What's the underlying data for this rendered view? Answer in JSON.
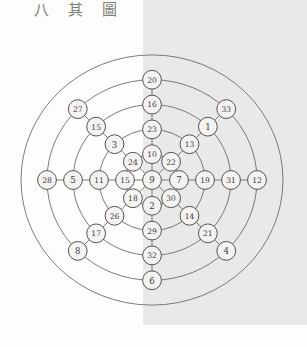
{
  "caption": {
    "text": "八 其 圖"
  },
  "figure": {
    "center": {
      "x": 152,
      "y": 180
    },
    "ring_radii": [
      27,
      53,
      79,
      105,
      131
    ],
    "colors": {
      "page_background": "#fdfdfc",
      "shade_panel": "#e9e9e7",
      "ring_stroke": "#6f6c68",
      "node_fill": "#f4f3f1",
      "node_stroke": "#555250",
      "label_text": "#3d3b39",
      "caption_text": "#7d7d7a"
    },
    "shade_panel": {
      "x": 143,
      "y": 0,
      "width": 164,
      "height": 325
    }
  },
  "chart_data": {
    "type": "diagram",
    "title": "八 其 圖",
    "spoke_count": 8,
    "ring_count": 5,
    "center_node": "9",
    "spokes": [
      {
        "name": "W",
        "angle_deg": 180,
        "nodes": [
          "15",
          "11",
          "5",
          "28"
        ]
      },
      {
        "name": "NW",
        "angle_deg": 135,
        "nodes": [
          "24",
          "3",
          "15",
          "27"
        ]
      },
      {
        "name": "N",
        "angle_deg": 90,
        "nodes": [
          "10",
          "23",
          "16",
          "20"
        ]
      },
      {
        "name": "NE",
        "angle_deg": 45,
        "nodes": [
          "22",
          "13",
          "1",
          "33"
        ]
      },
      {
        "name": "E",
        "angle_deg": 0,
        "nodes": [
          "7",
          "19",
          "31",
          "12"
        ]
      },
      {
        "name": "SE",
        "angle_deg": 315,
        "nodes": [
          "30",
          "14",
          "21",
          "4"
        ]
      },
      {
        "name": "S",
        "angle_deg": 270,
        "nodes": [
          "2",
          "29",
          "32",
          "6"
        ]
      },
      {
        "name": "SW",
        "angle_deg": 225,
        "nodes": [
          "18",
          "26",
          "17",
          "8"
        ]
      }
    ],
    "all_values": [
      "9",
      "15",
      "11",
      "5",
      "28",
      "24",
      "3",
      "15",
      "27",
      "10",
      "23",
      "16",
      "20",
      "22",
      "13",
      "1",
      "33",
      "7",
      "19",
      "31",
      "12",
      "30",
      "14",
      "21",
      "4",
      "2",
      "29",
      "32",
      "6",
      "18",
      "26",
      "17",
      "8"
    ],
    "node_count": 33
  }
}
